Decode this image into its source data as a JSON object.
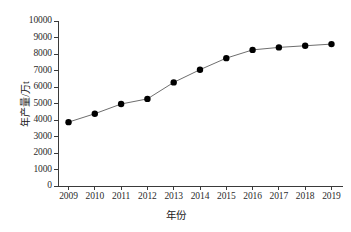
{
  "chart_data": {
    "type": "line",
    "title": "",
    "xlabel": "年份",
    "ylabel": "年产量/万t",
    "categories": [
      "2009",
      "2010",
      "2011",
      "2012",
      "2013",
      "2014",
      "2015",
      "2016",
      "2017",
      "2018",
      "2019"
    ],
    "x": [
      2009,
      2010,
      2011,
      2012,
      2013,
      2014,
      2015,
      2016,
      2017,
      2018,
      2019
    ],
    "values": [
      3870,
      4380,
      4970,
      5280,
      6280,
      7050,
      7750,
      8250,
      8400,
      8500,
      8600
    ],
    "series": [
      {
        "name": "年产量",
        "values": [
          3870,
          4380,
          4970,
          5280,
          6280,
          7050,
          7750,
          8250,
          8400,
          8500,
          8600
        ]
      }
    ],
    "ylim": [
      0,
      10000
    ],
    "xlim": [
      2008.6,
      2019.4
    ],
    "ytick_labels": [
      "0",
      "1000",
      "2000",
      "3000",
      "4000",
      "5000",
      "6000",
      "7000",
      "8000",
      "9000",
      "10000"
    ],
    "ytick_values": [
      0,
      1000,
      2000,
      3000,
      4000,
      5000,
      6000,
      7000,
      8000,
      9000,
      10000
    ],
    "xtick_labels": [
      "2009",
      "2010",
      "2011",
      "2012",
      "2013",
      "2014",
      "2015",
      "2016",
      "2017",
      "2018",
      "2019"
    ],
    "grid": false,
    "legend": false,
    "legend_position": "none",
    "marker": "filled-circle",
    "line_color": "#6e6e6e",
    "marker_color": "#000000",
    "axis_color": "#3a3a3a",
    "background_color": "#ffffff"
  }
}
